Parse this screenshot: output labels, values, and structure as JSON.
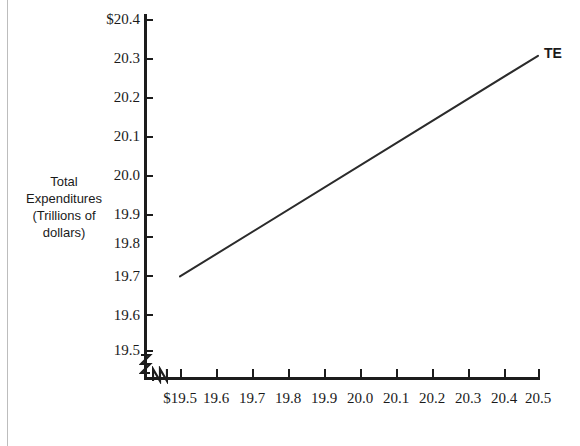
{
  "chart_data": {
    "type": "line",
    "title": "",
    "xlabel": "",
    "ylabel": "Total Expenditures (Trillions of dollars)",
    "grid": false,
    "legend_position": "inline-right-end",
    "xlim": [
      19.5,
      20.5
    ],
    "ylim": [
      19.5,
      20.4
    ],
    "x_tick_labels": [
      "$19.5",
      "19.6",
      "19.7",
      "19.8",
      "19.9",
      "20.0",
      "20.1",
      "20.2",
      "20.3",
      "20.4",
      "20.5"
    ],
    "x_tick_values": [
      19.5,
      19.6,
      19.7,
      19.8,
      19.9,
      20.0,
      20.1,
      20.2,
      20.3,
      20.4,
      20.5
    ],
    "y_tick_labels": [
      "$20.4",
      "20.3",
      "20.2",
      "20.1",
      "20.0",
      "19.9",
      "19.8",
      "19.7",
      "19.6",
      "19.5"
    ],
    "y_tick_values": [
      20.4,
      20.3,
      20.2,
      20.1,
      20.0,
      19.9,
      19.8,
      19.7,
      19.6,
      19.5
    ],
    "axis_break_y": "Z",
    "axis_break_x": "N",
    "series": [
      {
        "name": "TE",
        "label": "TE",
        "color": "#2b2b2b",
        "x": [
          19.5,
          20.5
        ],
        "values": [
          19.7,
          20.3
        ]
      }
    ],
    "annotations": [
      {
        "text": "TE",
        "x": 20.5,
        "y": 20.3
      }
    ]
  },
  "axis_title": {
    "line1": "Total",
    "line2": "Expenditures",
    "line3": "(Trillions of",
    "line4": "dollars)"
  },
  "colors": {
    "axis": "#1c1c1c",
    "line": "#2b2b2b",
    "text": "#1a1a1a",
    "page_edge": "#bdbdbd",
    "background": "#ffffff"
  }
}
